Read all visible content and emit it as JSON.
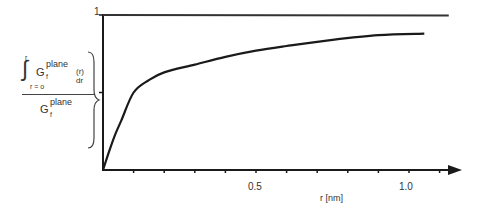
{
  "chart_data": {
    "type": "line",
    "title": "",
    "xlabel": "r  [nm]",
    "ylabel": "∫ from r=0 to r of G_f^plane(r) dr / G_f^plane",
    "xlim": [
      0,
      1.2
    ],
    "ylim": [
      0,
      1
    ],
    "x_ticks": [
      0.1,
      0.2,
      0.3,
      0.4,
      0.5,
      0.6,
      0.7,
      0.8,
      0.9,
      1.0,
      1.1
    ],
    "x_tick_labels": {
      "0.5": "0.5",
      "1.0": "1.0"
    },
    "y_ticks": [
      0.5,
      1
    ],
    "y_tick_labels": {
      "1": "1"
    },
    "grid": false,
    "legend": null,
    "reference_line": {
      "y": 1,
      "x_end": 1.13
    },
    "series": [
      {
        "name": "normalized cumulative integral",
        "x": [
          0,
          0.02,
          0.04,
          0.06,
          0.1,
          0.15,
          0.2,
          0.3,
          0.4,
          0.5,
          0.6,
          0.75,
          0.9,
          1.05
        ],
        "y": [
          0,
          0.12,
          0.23,
          0.32,
          0.5,
          0.58,
          0.63,
          0.68,
          0.73,
          0.77,
          0.8,
          0.84,
          0.87,
          0.88
        ]
      }
    ]
  },
  "labels": {
    "y_one": "1",
    "x_half": "0.5",
    "x_one": "1.0",
    "x_axis_title": "r  [nm]",
    "ylabel_int_upper": "r",
    "ylabel_int_lower": "r = o",
    "ylabel_G": "G",
    "ylabel_sup": "plane",
    "ylabel_sub": "f",
    "ylabel_rdr": "(r) dr"
  }
}
